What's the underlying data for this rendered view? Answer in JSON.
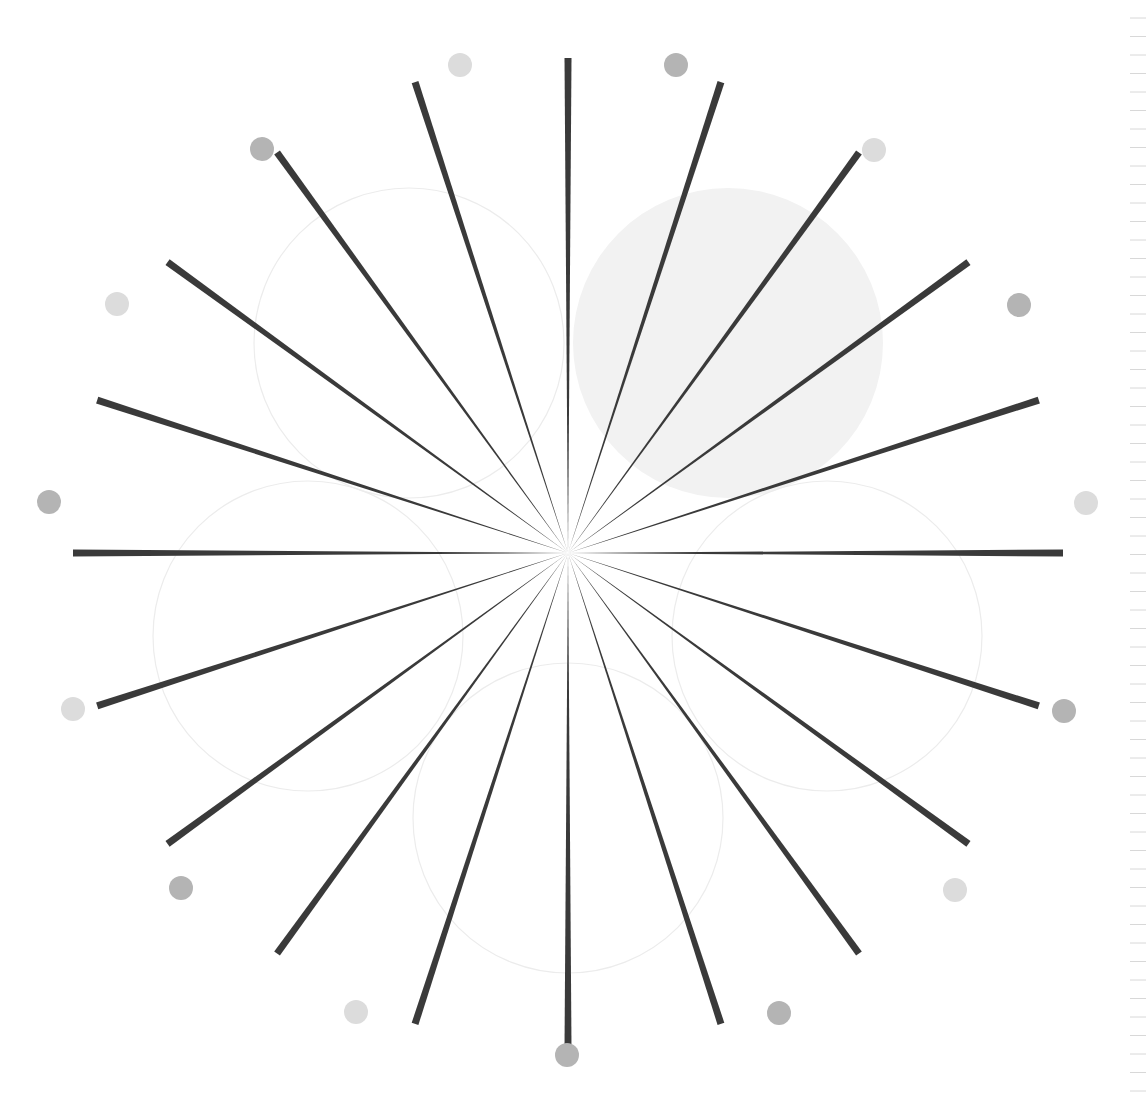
{
  "pattern": {
    "type": "siemens-star-spokes",
    "center": [
      568,
      553
    ],
    "spoke_count": 20,
    "spoke_angle_step_deg": 18,
    "spoke_length": 495,
    "spoke_color": "#3a3a3a",
    "spoke_max_width": 7,
    "dot_radius_px": 12,
    "dots": [
      {
        "x": 460,
        "y": 65,
        "color": "#dcdcdc"
      },
      {
        "x": 676,
        "y": 65,
        "color": "#b4b4b4"
      },
      {
        "x": 874,
        "y": 150,
        "color": "#dcdcdc"
      },
      {
        "x": 1019,
        "y": 305,
        "color": "#b4b4b4"
      },
      {
        "x": 1086,
        "y": 503,
        "color": "#dcdcdc"
      },
      {
        "x": 1064,
        "y": 711,
        "color": "#b4b4b4"
      },
      {
        "x": 955,
        "y": 890,
        "color": "#dcdcdc"
      },
      {
        "x": 779,
        "y": 1013,
        "color": "#b4b4b4"
      },
      {
        "x": 567,
        "y": 1055,
        "color": "#b4b4b4"
      },
      {
        "x": 356,
        "y": 1012,
        "color": "#dcdcdc"
      },
      {
        "x": 181,
        "y": 888,
        "color": "#b4b4b4"
      },
      {
        "x": 73,
        "y": 709,
        "color": "#dcdcdc"
      },
      {
        "x": 49,
        "y": 502,
        "color": "#b4b4b4"
      },
      {
        "x": 117,
        "y": 304,
        "color": "#dcdcdc"
      },
      {
        "x": 262,
        "y": 149,
        "color": "#b4b4b4"
      }
    ],
    "circles": [
      {
        "cx": 728,
        "cy": 343,
        "r": 155,
        "fill": "#f2f2f2",
        "stroke": "none"
      },
      {
        "cx": 409,
        "cy": 343,
        "r": 155,
        "fill": "none",
        "stroke": "#ececec"
      },
      {
        "cx": 308,
        "cy": 636,
        "r": 155,
        "fill": "none",
        "stroke": "#ececec"
      },
      {
        "cx": 568,
        "cy": 818,
        "r": 155,
        "fill": "none",
        "stroke": "#ececec"
      },
      {
        "cx": 827,
        "cy": 636,
        "r": 155,
        "fill": "none",
        "stroke": "#ececec"
      }
    ],
    "ruler": {
      "x": 1130,
      "tick_spacing": 18.5,
      "color": "#d8d8d8"
    }
  }
}
